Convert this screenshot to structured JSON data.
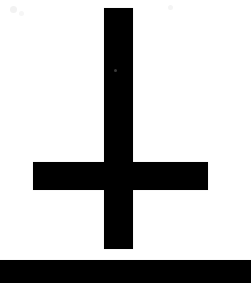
{
  "image": {
    "title": "Inverted Cross",
    "description": "Scanned black-and-white inverted cross (Cross of Saint Peter) on a white background, with a solid black band across the bottom edge.",
    "width": 251,
    "height": 283,
    "background_color": "#ffffff",
    "foreground_color": "#000000",
    "style": "scanned monochrome line art"
  },
  "symbol": {
    "name": "inverted-cross",
    "alt_names": [
      "Cross of Saint Peter",
      "Petrine Cross",
      "upside-down cross"
    ],
    "orientation": "inverted",
    "vertical_bar": {
      "label": "Vertical stem",
      "x": 104,
      "y": 8,
      "width": 29,
      "height": 241,
      "color": "#000000"
    },
    "horizontal_bar": {
      "label": "Horizontal crossbeam",
      "x": 33,
      "y": 162,
      "width": 175,
      "height": 28,
      "color": "#000000"
    }
  },
  "bottom_band": {
    "label": "Black band at bottom edge",
    "x": 0,
    "y": 260,
    "width": 251,
    "height": 23,
    "color": "#000000"
  },
  "artifacts": [
    {
      "name": "speck-top-left",
      "x": 10,
      "y": 6,
      "size": 7,
      "color": "#f2f2f2"
    },
    {
      "name": "speck-top-left-2",
      "x": 19,
      "y": 11,
      "size": 5,
      "color": "#f6f6f6"
    },
    {
      "name": "speck-top-right",
      "x": 168,
      "y": 5,
      "size": 5,
      "color": "#f4f4f4"
    },
    {
      "name": "speck-in-bar",
      "x": 114,
      "y": 69,
      "size": 3,
      "color": "#3a3a3a"
    }
  ]
}
